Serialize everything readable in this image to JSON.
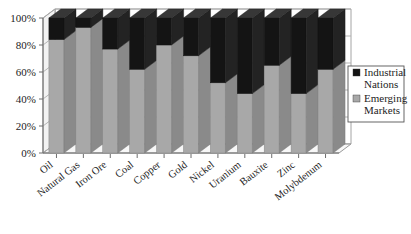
{
  "chart_data": {
    "type": "bar",
    "subtype": "stacked-bar-100-percent-3d",
    "title": "",
    "xlabel": "",
    "ylabel": "",
    "ylim": [
      0,
      100
    ],
    "ytick_labels": [
      "0%",
      "20%",
      "40%",
      "60%",
      "80%",
      "100%"
    ],
    "ytick_values": [
      0,
      20,
      40,
      60,
      80,
      100
    ],
    "grid": true,
    "legend_position": "right",
    "categories": [
      "Oil",
      "Natural Gas",
      "Iron Ore",
      "Coal",
      "Copper",
      "Gold",
      "Nickel",
      "Uranium",
      "Bauxite",
      "Zinc",
      "Molybdenum"
    ],
    "series": [
      {
        "name": "Emerging Markets",
        "color": "#a8a8a8",
        "values": [
          84,
          93,
          77,
          62,
          80,
          72,
          52,
          44,
          65,
          44,
          62
        ]
      },
      {
        "name": "Industrial Nations",
        "color": "#141414",
        "values": [
          16,
          7,
          23,
          38,
          20,
          28,
          48,
          56,
          35,
          56,
          38
        ]
      }
    ]
  },
  "legend": {
    "entries": [
      {
        "label_line1": "Industrial",
        "label_line2": "Nations",
        "swatch": "#141414"
      },
      {
        "label_line1": "Emerging",
        "label_line2": "Markets",
        "swatch": "#a8a8a8"
      }
    ]
  }
}
